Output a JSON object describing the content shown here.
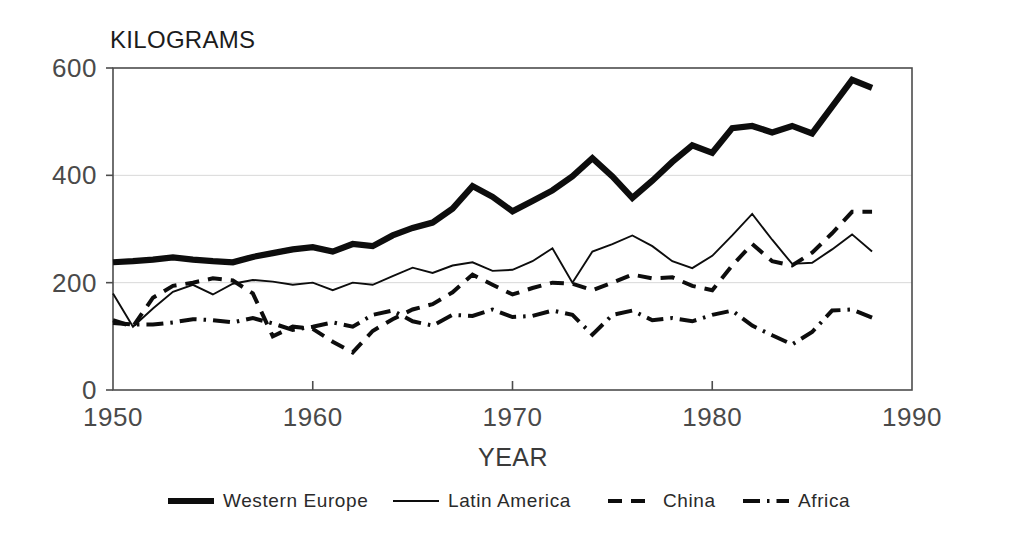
{
  "chart_data": {
    "type": "line",
    "title": "KILOGRAMS",
    "xlabel": "YEAR",
    "ylabel": "KILOGRAMS",
    "xlim": [
      1950,
      1990
    ],
    "ylim": [
      0,
      600
    ],
    "xticks": [
      "1950",
      "1960",
      "1970",
      "1980",
      "1990"
    ],
    "yticks": [
      "0",
      "200",
      "400",
      "600"
    ],
    "grid": "horizontal gridlines at 200 and 400",
    "legend_position": "bottom-center",
    "x": [
      1950,
      1951,
      1952,
      1953,
      1954,
      1955,
      1956,
      1957,
      1958,
      1959,
      1960,
      1961,
      1962,
      1963,
      1964,
      1965,
      1966,
      1967,
      1968,
      1969,
      1970,
      1971,
      1972,
      1973,
      1974,
      1975,
      1976,
      1977,
      1978,
      1979,
      1980,
      1981,
      1982,
      1983,
      1984,
      1985,
      1986,
      1987,
      1988
    ],
    "series": [
      {
        "name": "Western Europe",
        "style": "thick-solid",
        "values": [
          238,
          240,
          243,
          247,
          243,
          240,
          238,
          248,
          255,
          262,
          266,
          258,
          272,
          268,
          288,
          302,
          312,
          338,
          380,
          360,
          333,
          352,
          372,
          398,
          432,
          398,
          358,
          390,
          425,
          456,
          442,
          488,
          492,
          480,
          492,
          478,
          528,
          578,
          563
        ]
      },
      {
        "name": "Latin America",
        "style": "thin-solid",
        "values": [
          180,
          118,
          152,
          183,
          196,
          178,
          198,
          205,
          202,
          196,
          200,
          186,
          200,
          196,
          212,
          228,
          218,
          232,
          238,
          222,
          224,
          240,
          264,
          200,
          258,
          272,
          288,
          268,
          240,
          227,
          250,
          288,
          328,
          280,
          235,
          237,
          262,
          290,
          258
        ]
      },
      {
        "name": "China",
        "style": "dashed",
        "values": [
          130,
          118,
          172,
          194,
          200,
          208,
          204,
          180,
          100,
          118,
          114,
          90,
          70,
          110,
          132,
          150,
          160,
          182,
          215,
          196,
          178,
          190,
          200,
          198,
          186,
          200,
          215,
          208,
          210,
          194,
          186,
          232,
          272,
          240,
          232,
          256,
          292,
          332,
          332
        ]
      },
      {
        "name": "Africa",
        "style": "dash-dot",
        "values": [
          125,
          122,
          122,
          126,
          132,
          130,
          126,
          134,
          124,
          112,
          118,
          126,
          118,
          140,
          148,
          128,
          120,
          140,
          138,
          150,
          136,
          138,
          148,
          140,
          103,
          140,
          148,
          130,
          134,
          128,
          140,
          148,
          120,
          102,
          85,
          108,
          148,
          150,
          135
        ]
      }
    ]
  },
  "axis": {
    "y_title": "KILOGRAMS",
    "x_title": "YEAR",
    "y_tick_600": "600",
    "y_tick_400": "400",
    "y_tick_200": "200",
    "y_tick_0": "0",
    "x_tick_1950": "1950",
    "x_tick_1960": "1960",
    "x_tick_1970": "1970",
    "x_tick_1980": "1980",
    "x_tick_1990": "1990"
  },
  "legend": {
    "items": [
      {
        "label": "Western Europe",
        "style": "thick-solid"
      },
      {
        "label": "Latin America",
        "style": "thin-solid"
      },
      {
        "label": "China",
        "style": "dashed"
      },
      {
        "label": "Africa",
        "style": "dash-dot"
      }
    ]
  },
  "colors": {
    "ink": "#0d0d0d",
    "axis": "#4d4d4d",
    "grid": "#d8d8d8",
    "background": "#ffffff"
  }
}
